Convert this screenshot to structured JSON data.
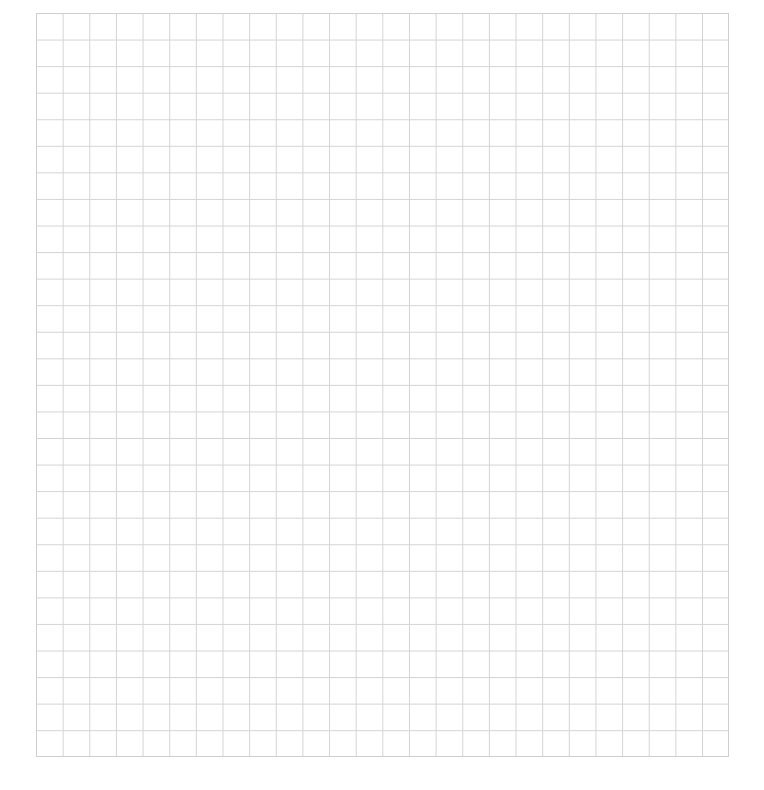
{
  "page": {
    "type": "blank-grid-paper",
    "grid": {
      "columns": 26,
      "rows": 28,
      "line_color": "#d4d4d4",
      "background": "#ffffff"
    }
  }
}
